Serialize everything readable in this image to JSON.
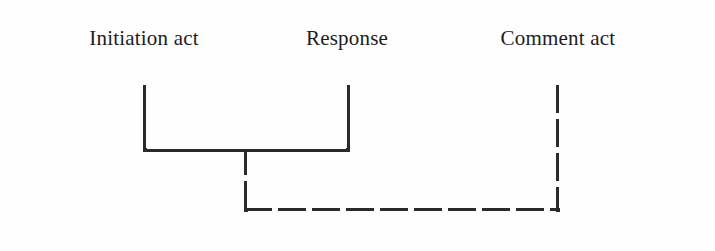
{
  "figure": {
    "background_color": "#fefefe",
    "line_color": "#2b2b2b",
    "width": 715,
    "height": 251
  },
  "labels": [
    {
      "id": "initiation-act",
      "text": "Initiation act",
      "center_x": 144,
      "y": 28
    },
    {
      "id": "response",
      "text": "Response",
      "center_x": 347,
      "y": 28
    },
    {
      "id": "comment-act",
      "text": "Comment act",
      "center_x": 558,
      "y": 28
    }
  ],
  "brackets": {
    "solid": {
      "style": "solid",
      "left_x": 143,
      "right_x": 348,
      "top_y": 85,
      "bottom_y": 150,
      "stem_x": 245,
      "description": "Initiation act + Response joined by solid bracket"
    },
    "dashed": {
      "style": "dashed",
      "left_x": 245,
      "right_x": 558,
      "top_y": 85,
      "bottom_y": 209,
      "description": "Joined Initiation+Response unit linked to Comment act by dashed bracket"
    }
  }
}
